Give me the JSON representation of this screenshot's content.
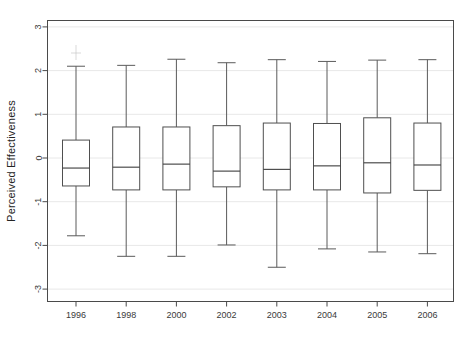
{
  "chart_data": {
    "type": "box",
    "title": "",
    "subtitle": "",
    "xlabel": "",
    "ylabel": "Perceived Effectiveness",
    "categories": [
      "1996",
      "1998",
      "2000",
      "2002",
      "2003",
      "2004",
      "2005",
      "2006"
    ],
    "ylim": [
      -3.2,
      3.2
    ],
    "yticks": [
      -3,
      -2,
      -1,
      0,
      1,
      2,
      3
    ],
    "ytick_labels": [
      "-3",
      "-2",
      "-1",
      "0",
      "1",
      "2",
      "3"
    ],
    "grid": true,
    "legend": "none",
    "boxes": [
      {
        "category": "1996",
        "whisker_low": -1.78,
        "q1": -0.64,
        "median": -0.23,
        "q3": 0.41,
        "whisker_high": 2.1
      },
      {
        "category": "1998",
        "whisker_low": -2.25,
        "q1": -0.73,
        "median": -0.21,
        "q3": 0.71,
        "whisker_high": 2.12
      },
      {
        "category": "2000",
        "whisker_low": -2.25,
        "q1": -0.73,
        "median": -0.14,
        "q3": 0.71,
        "whisker_high": 2.26
      },
      {
        "category": "2002",
        "whisker_low": -1.99,
        "q1": -0.66,
        "median": -0.3,
        "q3": 0.74,
        "whisker_high": 2.18
      },
      {
        "category": "2003",
        "whisker_low": -2.5,
        "q1": -0.73,
        "median": -0.26,
        "q3": 0.8,
        "whisker_high": 2.25
      },
      {
        "category": "2004",
        "whisker_low": -2.08,
        "q1": -0.73,
        "median": -0.18,
        "q3": 0.79,
        "whisker_high": 2.21
      },
      {
        "category": "2005",
        "whisker_low": -2.15,
        "q1": -0.8,
        "median": -0.11,
        "q3": 0.92,
        "whisker_high": 2.24
      },
      {
        "category": "2006",
        "whisker_low": -2.19,
        "q1": -0.74,
        "median": -0.16,
        "q3": 0.8,
        "whisker_high": 2.25
      }
    ]
  },
  "colors": {
    "box_stroke": "#4f4f4f",
    "median_stroke": "#3d3d3d",
    "whisker_stroke": "#5a5a5a",
    "frame_stroke": "#4a4a4a",
    "grid": "#e8e8e8",
    "background": "#ffffff"
  }
}
